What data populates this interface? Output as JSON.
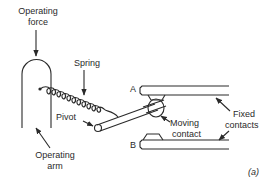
{
  "diagram": {
    "type": "mechanical-switch-schematic",
    "labels": {
      "operating_force": [
        "Operating",
        "force"
      ],
      "spring": "Spring",
      "pivot": "Pivot",
      "operating_arm": [
        "Operating",
        "arm"
      ],
      "contact_a": "A",
      "contact_b": "B",
      "moving_contact": [
        "Moving",
        "contact"
      ],
      "fixed_contacts": [
        "Fixed",
        "contacts"
      ],
      "panel": "(a)"
    },
    "colors": {
      "ink": "#2a2a2a",
      "background": "#ffffff"
    }
  }
}
